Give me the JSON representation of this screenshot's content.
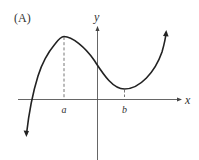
{
  "figure": {
    "panel_label": "(A)",
    "x_axis_label": "x",
    "y_axis_label": "y",
    "point_a_label": "a",
    "point_b_label": "b",
    "colors": {
      "curve": "#222222",
      "axes": "#555555",
      "dashes": "#666666",
      "text": "#333333"
    }
  },
  "description": {
    "curve_type": "cubic-like function",
    "local_maximum_at": "a",
    "local_minimum_at": "b",
    "a_position": "negative x",
    "b_position": "positive x"
  }
}
